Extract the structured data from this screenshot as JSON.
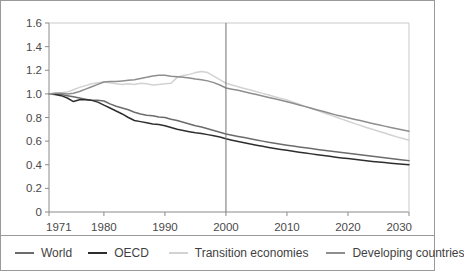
{
  "chart_data": {
    "type": "line",
    "title": "",
    "subtitle": "",
    "xlabel": "",
    "ylabel": "",
    "xlim": [
      1971,
      2030
    ],
    "ylim": [
      0,
      1.6
    ],
    "grid": false,
    "legend_position": "bottom",
    "x_ticks": [
      "1971",
      "1980",
      "1990",
      "2000",
      "2010",
      "2020",
      "2030"
    ],
    "x_tick_values": [
      1971,
      1980,
      1990,
      2000,
      2010,
      2020,
      2030
    ],
    "y_ticks": [
      "0",
      "0.2",
      "0.4",
      "0.6",
      "0.8",
      "1.0",
      "1.2",
      "1.4",
      "1.6"
    ],
    "y_tick_values": [
      0,
      0.2,
      0.4,
      0.6,
      0.8,
      1.0,
      1.2,
      1.4,
      1.6
    ],
    "annotations": [
      {
        "name": "projection-divider",
        "type": "vline",
        "x": 2000,
        "label": ""
      }
    ],
    "x": [
      1971,
      1972,
      1973,
      1974,
      1975,
      1976,
      1977,
      1978,
      1979,
      1980,
      1981,
      1982,
      1983,
      1984,
      1985,
      1986,
      1987,
      1988,
      1989,
      1990,
      1991,
      1992,
      1993,
      1994,
      1995,
      1996,
      1997,
      1998,
      1999,
      2000,
      2001,
      2002,
      2003,
      2004,
      2005,
      2006,
      2007,
      2008,
      2009,
      2010,
      2011,
      2012,
      2013,
      2014,
      2015,
      2016,
      2017,
      2018,
      2019,
      2020,
      2021,
      2022,
      2023,
      2024,
      2025,
      2026,
      2027,
      2028,
      2029,
      2030
    ],
    "series": [
      {
        "name": "World",
        "color": "#6b6b6b",
        "values": [
          1.0,
          1.0,
          0.995,
          0.985,
          0.975,
          0.965,
          0.955,
          0.945,
          0.945,
          0.94,
          0.915,
          0.895,
          0.88,
          0.865,
          0.845,
          0.83,
          0.82,
          0.815,
          0.805,
          0.8,
          0.785,
          0.775,
          0.76,
          0.745,
          0.73,
          0.72,
          0.705,
          0.69,
          0.675,
          0.66,
          0.65,
          0.64,
          0.63,
          0.62,
          0.61,
          0.6,
          0.59,
          0.582,
          0.574,
          0.566,
          0.558,
          0.551,
          0.544,
          0.537,
          0.53,
          0.523,
          0.516,
          0.51,
          0.504,
          0.498,
          0.491,
          0.485,
          0.478,
          0.472,
          0.466,
          0.46,
          0.453,
          0.447,
          0.441,
          0.435
        ]
      },
      {
        "name": "OECD",
        "color": "#2e2e2e",
        "values": [
          1.0,
          0.995,
          0.985,
          0.965,
          0.935,
          0.95,
          0.95,
          0.945,
          0.93,
          0.905,
          0.88,
          0.855,
          0.83,
          0.8,
          0.775,
          0.765,
          0.755,
          0.745,
          0.74,
          0.73,
          0.715,
          0.7,
          0.69,
          0.68,
          0.67,
          0.665,
          0.655,
          0.645,
          0.635,
          0.62,
          0.608,
          0.597,
          0.586,
          0.576,
          0.566,
          0.556,
          0.547,
          0.538,
          0.53,
          0.522,
          0.514,
          0.506,
          0.499,
          0.492,
          0.485,
          0.478,
          0.471,
          0.464,
          0.458,
          0.452,
          0.446,
          0.44,
          0.434,
          0.428,
          0.423,
          0.418,
          0.413,
          0.408,
          0.404,
          0.4
        ]
      },
      {
        "name": "Transition economies",
        "color": "#d2d2d2",
        "values": [
          1.0,
          1.005,
          1.01,
          1.015,
          1.035,
          1.055,
          1.07,
          1.085,
          1.095,
          1.1,
          1.095,
          1.085,
          1.08,
          1.085,
          1.08,
          1.09,
          1.085,
          1.075,
          1.08,
          1.085,
          1.09,
          1.14,
          1.155,
          1.165,
          1.18,
          1.19,
          1.18,
          1.15,
          1.12,
          1.09,
          1.075,
          1.06,
          1.046,
          1.032,
          1.018,
          1.004,
          0.99,
          0.976,
          0.962,
          0.948,
          0.93,
          0.912,
          0.894,
          0.876,
          0.858,
          0.84,
          0.822,
          0.804,
          0.786,
          0.768,
          0.75,
          0.733,
          0.716,
          0.7,
          0.684,
          0.668,
          0.652,
          0.636,
          0.622,
          0.608
        ]
      },
      {
        "name": "Developing countries",
        "color": "#8e8e8e",
        "values": [
          1.0,
          1.005,
          1.005,
          1.0,
          1.005,
          1.02,
          1.04,
          1.06,
          1.08,
          1.1,
          1.105,
          1.105,
          1.11,
          1.115,
          1.12,
          1.13,
          1.14,
          1.152,
          1.158,
          1.158,
          1.15,
          1.145,
          1.14,
          1.135,
          1.125,
          1.12,
          1.11,
          1.095,
          1.075,
          1.05,
          1.04,
          1.03,
          1.018,
          1.006,
          0.994,
          0.982,
          0.97,
          0.958,
          0.946,
          0.934,
          0.92,
          0.906,
          0.892,
          0.878,
          0.864,
          0.85,
          0.836,
          0.822,
          0.81,
          0.798,
          0.786,
          0.774,
          0.762,
          0.75,
          0.738,
          0.727,
          0.716,
          0.705,
          0.694,
          0.684
        ]
      }
    ]
  },
  "legend": {
    "items": [
      {
        "label": "World",
        "color": "#6b6b6b"
      },
      {
        "label": "OECD",
        "color": "#2e2e2e"
      },
      {
        "label": "Transition economies",
        "color": "#d2d2d2"
      },
      {
        "label": "Developing countries",
        "color": "#8e8e8e"
      }
    ]
  },
  "colors": {
    "frame": "#9a9a9a",
    "axis": "#8a8a8a",
    "text": "#3f3f3f",
    "background": "#ffffff"
  }
}
